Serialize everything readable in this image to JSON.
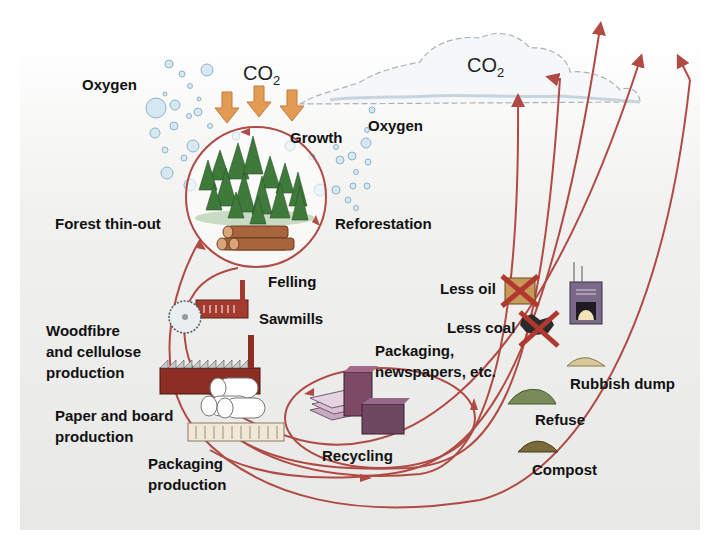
{
  "diagram": {
    "colors": {
      "background_panel": "#ececea",
      "flow_line": "#b04a44",
      "co2_arrow": "#e39a52",
      "tree": "#3f7a3a",
      "log": "#a8643c",
      "bubble": "#d6e9f2",
      "bubble_stroke": "#8fb3c8",
      "cloud": "#f4f6f8",
      "label": "#111111"
    },
    "labels": {
      "oxygen_left": "Oxygen",
      "co2_top": "CO",
      "co2_top_sub": "2",
      "growth": "Growth",
      "oxygen_right": "Oxygen",
      "co2_cloud": "CO",
      "co2_cloud_sub": "2",
      "forest_thin_out": "Forest thin-out",
      "reforestation": "Reforestation",
      "felling": "Felling",
      "sawmills": "Sawmills",
      "woodfibre_line1": "Woodfibre",
      "woodfibre_line2": "and cellulose",
      "woodfibre_line3": "production",
      "paper_line1": "Paper and board",
      "paper_line2": "production",
      "packaging_prod_line1": "Packaging",
      "packaging_prod_line2": "production",
      "packaging_news_line1": "Packaging,",
      "packaging_news_line2": "newspapers, etc.",
      "recycling": "Recycling",
      "less_oil": "Less oil",
      "less_coal": "Less coal",
      "rubbish_dump": "Rubbish dump",
      "refuse": "Refuse",
      "compost": "Compost"
    },
    "nodes": [
      {
        "id": "forest",
        "label": "Growth"
      },
      {
        "id": "felling",
        "label": "Felling"
      },
      {
        "id": "sawmills",
        "label": "Sawmills"
      },
      {
        "id": "woodfibre",
        "label": "Woodfibre and cellulose production"
      },
      {
        "id": "paper",
        "label": "Paper and board production"
      },
      {
        "id": "packaging",
        "label": "Packaging production"
      },
      {
        "id": "products",
        "label": "Packaging, newspapers, etc."
      },
      {
        "id": "recycling",
        "label": "Recycling"
      },
      {
        "id": "incineration",
        "label": "Less oil / Less coal"
      },
      {
        "id": "rubbish_dump",
        "label": "Rubbish dump"
      },
      {
        "id": "refuse",
        "label": "Refuse"
      },
      {
        "id": "compost",
        "label": "Compost"
      },
      {
        "id": "atmosphere",
        "label": "CO2"
      }
    ]
  }
}
